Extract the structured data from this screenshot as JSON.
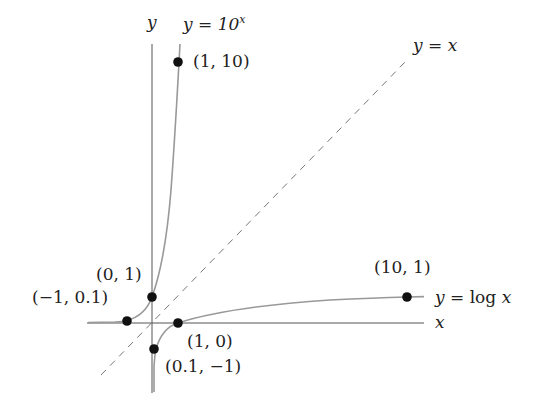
{
  "diagram": {
    "axes": {
      "x_label": "x",
      "y_label": "y"
    },
    "curves": [
      {
        "name": "exponential",
        "label_prefix": "y = 10",
        "label_exp": "x"
      },
      {
        "name": "logarithm",
        "label": "y = log x",
        "label_prefix": "y = ",
        "label_fn": "log",
        "label_var": "x"
      },
      {
        "name": "identity",
        "label": "y = x",
        "style": "dashed"
      }
    ],
    "points": {
      "p1": "(1, 10)",
      "p2": "(0, 1)",
      "p3": "(−1, 0.1)",
      "p4": "(10, 1)",
      "p5": "(1, 0)",
      "p6": "(0.1, −1)"
    },
    "colors": {
      "axis": "#555555",
      "curve": "#999999",
      "dash": "#777777",
      "dot": "#111111",
      "text": "#222222"
    }
  }
}
